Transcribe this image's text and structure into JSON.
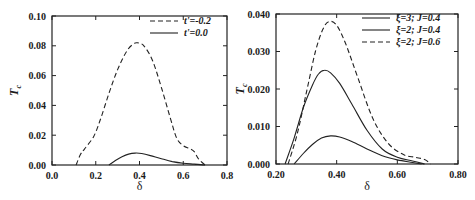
{
  "chart_data": [
    {
      "type": "line",
      "title": "",
      "xlabel": "δ",
      "ylabel": "T_c",
      "xlim": [
        0.0,
        0.8
      ],
      "ylim": [
        0.0,
        0.1
      ],
      "xticks": [
        "0.0",
        "0.2",
        "0.4",
        "0.6",
        "0.8"
      ],
      "yticks": [
        "0.00",
        "0.02",
        "0.04",
        "0.06",
        "0.08",
        "0.10"
      ],
      "grid": false,
      "legend_position": "upper right",
      "series": [
        {
          "name": "t'=-0.2",
          "style": "dashed",
          "x": [
            0.11,
            0.13,
            0.15,
            0.19,
            0.22,
            0.26,
            0.3,
            0.34,
            0.37,
            0.39,
            0.42,
            0.46,
            0.5,
            0.54,
            0.57,
            0.6,
            0.63,
            0.65,
            0.67,
            0.7
          ],
          "y": [
            0.0,
            0.007,
            0.011,
            0.019,
            0.03,
            0.048,
            0.064,
            0.076,
            0.081,
            0.082,
            0.08,
            0.07,
            0.052,
            0.032,
            0.018,
            0.013,
            0.011,
            0.009,
            0.004,
            0.0
          ]
        },
        {
          "name": "t'=0.0",
          "style": "solid",
          "x": [
            0.26,
            0.29,
            0.32,
            0.35,
            0.38,
            0.41,
            0.45,
            0.5,
            0.55,
            0.6,
            0.65,
            0.7
          ],
          "y": [
            0.0,
            0.003,
            0.0055,
            0.0073,
            0.008,
            0.0077,
            0.0063,
            0.0042,
            0.0023,
            0.0012,
            0.0006,
            0.0
          ]
        }
      ]
    },
    {
      "type": "line",
      "title": "",
      "xlabel": "δ",
      "ylabel": "T_c",
      "xlim": [
        0.2,
        0.8
      ],
      "ylim": [
        0.0,
        0.04
      ],
      "xticks": [
        "0.20",
        "0.40",
        "0.60",
        "0.80"
      ],
      "yticks": [
        "0.000",
        "0.010",
        "0.020",
        "0.030",
        "0.040"
      ],
      "grid": false,
      "legend_position": "upper right",
      "series": [
        {
          "name": "ξ=3; J=0.4",
          "style": "solid",
          "x": [
            0.26,
            0.29,
            0.32,
            0.35,
            0.38,
            0.41,
            0.45,
            0.5,
            0.55,
            0.6,
            0.65,
            0.68
          ],
          "y": [
            0.0,
            0.0028,
            0.0052,
            0.0069,
            0.0075,
            0.0072,
            0.006,
            0.004,
            0.0022,
            0.0011,
            0.0004,
            0.0
          ]
        },
        {
          "name": "ξ=2; J=0.4",
          "style": "solid",
          "x": [
            0.23,
            0.26,
            0.29,
            0.32,
            0.34,
            0.36,
            0.38,
            0.41,
            0.45,
            0.5,
            0.55,
            0.6,
            0.65,
            0.69
          ],
          "y": [
            0.0,
            0.007,
            0.015,
            0.021,
            0.024,
            0.025,
            0.0243,
            0.0215,
            0.016,
            0.009,
            0.004,
            0.0018,
            0.0008,
            0.0
          ]
        },
        {
          "name": "ξ=2; J=0.6",
          "style": "dashed",
          "x": [
            0.24,
            0.27,
            0.3,
            0.33,
            0.355,
            0.375,
            0.4,
            0.43,
            0.47,
            0.52,
            0.57,
            0.62,
            0.66,
            0.69,
            0.71
          ],
          "y": [
            0.0,
            0.008,
            0.019,
            0.03,
            0.036,
            0.038,
            0.037,
            0.032,
            0.023,
            0.012,
            0.0055,
            0.0025,
            0.0018,
            0.0012,
            0.0
          ]
        }
      ]
    }
  ]
}
